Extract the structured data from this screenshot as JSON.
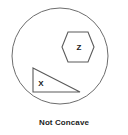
{
  "figure": {
    "caption": "Not Concave",
    "colors": {
      "background": "#ffffff",
      "outline": "#6d6d6d",
      "label_text": "#1a1a1a",
      "caption_text": "#1c1c1c"
    },
    "boundary": {
      "name": "circle",
      "center_x": 60,
      "center_y": 56,
      "radius": 48
    },
    "shapes": [
      {
        "name": "hexagon",
        "label": "Z",
        "sides": 6,
        "orientation": "flat-top",
        "center_x": 78,
        "center_y": 47,
        "label_x": 79,
        "label_y": 48,
        "points": "68,32 88,32 94,47 88,62 68,62 62,47"
      },
      {
        "name": "right-triangle",
        "label": "X",
        "sides": 3,
        "right_angle_corner": "bottom-left",
        "label_x": 41,
        "label_y": 84,
        "points": "33,68 80,92 33,92"
      }
    ]
  }
}
